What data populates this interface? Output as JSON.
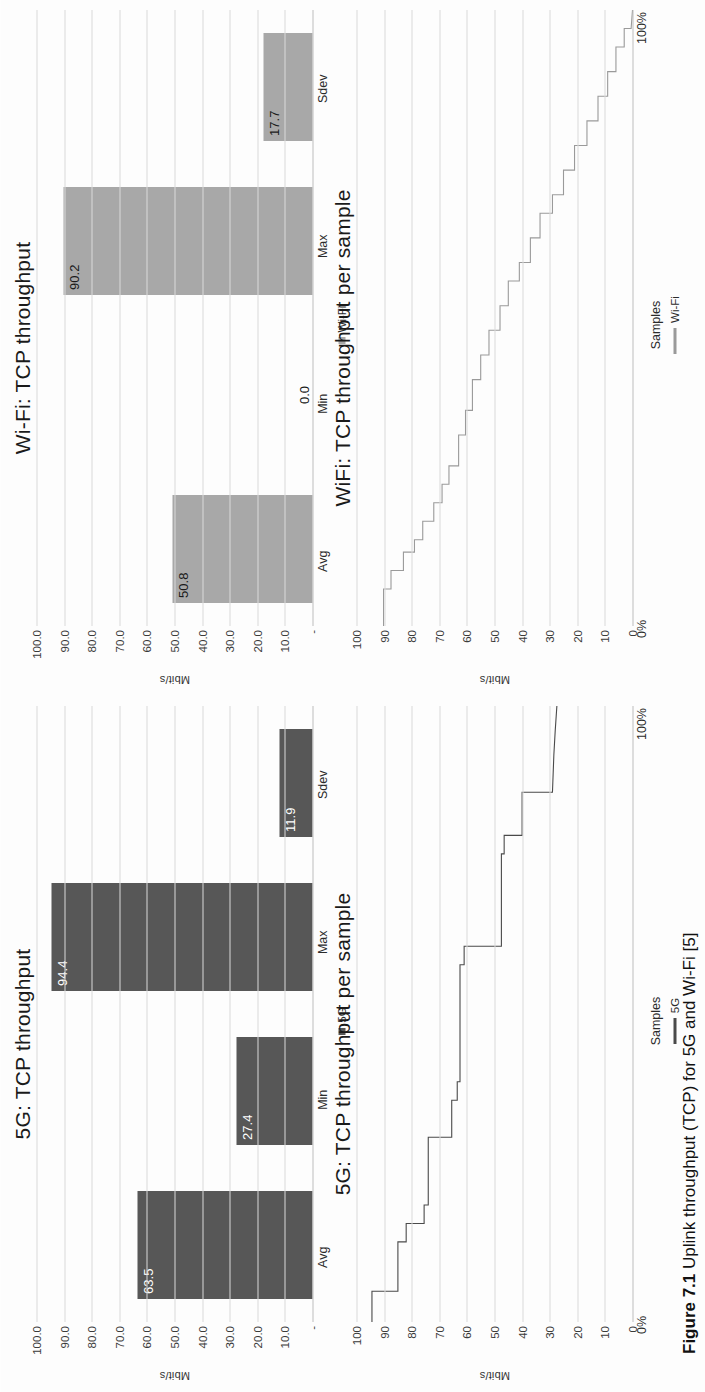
{
  "page": {
    "caption_label": "Figure 7.1",
    "caption_text": "Uplink throughput (TCP) for 5G and Wi-Fi [5]"
  },
  "panels": {
    "fiveg_bar": {
      "title": "5G: TCP throughput",
      "ylabel": "Mbit/s",
      "legend": "5G",
      "yticks": [
        "100.0",
        "90.0",
        "80.0",
        "70.0",
        "60.0",
        "50.0",
        "40.0",
        "30.0",
        "20.0",
        "10.0",
        "-"
      ]
    },
    "wifi_bar": {
      "title": "Wi-Fi: TCP throughput",
      "ylabel": "Mbit/s",
      "legend": "Wi-Fi",
      "yticks": [
        "100.0",
        "90.0",
        "80.0",
        "70.0",
        "60.0",
        "50.0",
        "40.0",
        "30.0",
        "20.0",
        "10.0",
        "-"
      ]
    },
    "fiveg_line": {
      "title": "5G: TCP throughput per sample",
      "ylabel": "Mbit/s",
      "xlabel": "Samples",
      "legend": "5G",
      "x_start": "0%",
      "x_end": "100%",
      "yticks": [
        "100",
        "90",
        "80",
        "70",
        "60",
        "50",
        "40",
        "30",
        "20",
        "10",
        "0"
      ]
    },
    "wifi_line": {
      "title": "WiFi: TCP throughput per sample",
      "ylabel": "Mbit/s",
      "xlabel": "Samples",
      "legend": "Wi-Fi",
      "x_start": "0%",
      "x_end": "100%",
      "yticks": [
        "100",
        "90",
        "80",
        "70",
        "60",
        "50",
        "40",
        "30",
        "20",
        "10",
        "0"
      ]
    }
  },
  "colors": {
    "bar_5g": "#575757",
    "bar_wifi": "#a8a8a8",
    "line_5g": "#4a4a4a",
    "line_wifi": "#9a9a9a",
    "gridline": "#d9d9d9"
  },
  "chart_data": [
    {
      "id": "fiveg_bar",
      "type": "bar",
      "title": "5G: TCP throughput",
      "xlabel": "",
      "ylabel": "Mbit/s",
      "ylim": [
        0,
        100
      ],
      "grid": true,
      "legend": "5G",
      "legend_position": "bottom",
      "categories": [
        "Avg",
        "Min",
        "Max",
        "Sdev"
      ],
      "values": [
        63.5,
        27.4,
        94.4,
        11.9
      ],
      "data_labels": [
        "63.5",
        "27.4",
        "94.4",
        "11.9"
      ],
      "tick_labels": [
        "100.0",
        "90.0",
        "80.0",
        "70.0",
        "60.0",
        "50.0",
        "40.0",
        "30.0",
        "20.0",
        "10.0",
        "-"
      ]
    },
    {
      "id": "wifi_bar",
      "type": "bar",
      "title": "Wi-Fi: TCP throughput",
      "xlabel": "",
      "ylabel": "Mbit/s",
      "ylim": [
        0,
        100
      ],
      "grid": true,
      "legend": "Wi-Fi",
      "legend_position": "bottom",
      "categories": [
        "Avg",
        "Min",
        "Max",
        "Sdev"
      ],
      "values": [
        50.8,
        0.0,
        90.2,
        17.7
      ],
      "data_labels": [
        "50.8",
        "0.0",
        "90.2",
        "17.7"
      ],
      "tick_labels": [
        "100.0",
        "90.0",
        "80.0",
        "70.0",
        "60.0",
        "50.0",
        "40.0",
        "30.0",
        "20.0",
        "10.0",
        "-"
      ]
    },
    {
      "id": "fiveg_line",
      "type": "line",
      "title": "5G: TCP throughput per sample",
      "xlabel": "Samples",
      "ylabel": "Mbit/s",
      "ylim": [
        0,
        100
      ],
      "xlim": [
        0,
        100
      ],
      "grid": true,
      "legend": "5G",
      "legend_position": "bottom",
      "x_tick_labels": [
        "0%",
        "100%"
      ],
      "y_tick_labels": [
        "100",
        "90",
        "80",
        "70",
        "60",
        "50",
        "40",
        "30",
        "20",
        "10",
        "0"
      ],
      "x": [
        0,
        5,
        5,
        13,
        13,
        16,
        16,
        19,
        19,
        30,
        30,
        36,
        36,
        39,
        39,
        58,
        58,
        61,
        61,
        76,
        76,
        79,
        79,
        86,
        86,
        92,
        96,
        100
      ],
      "y": [
        94.4,
        94.4,
        85.0,
        85.0,
        82.0,
        82.0,
        75.5,
        75.5,
        74.0,
        74.0,
        65.5,
        65.5,
        63.5,
        63.5,
        62.5,
        62.5,
        61.0,
        61.0,
        47.5,
        47.5,
        46.5,
        46.5,
        40.0,
        40.0,
        29.0,
        28.5,
        28.0,
        27.4
      ]
    },
    {
      "id": "wifi_line",
      "type": "line",
      "title": "WiFi: TCP throughput per sample",
      "xlabel": "Samples",
      "ylabel": "Mbit/s",
      "ylim": [
        0,
        100
      ],
      "xlim": [
        0,
        100
      ],
      "grid": true,
      "legend": "Wi-Fi",
      "legend_position": "bottom",
      "x_tick_labels": [
        "0%",
        "100%"
      ],
      "y_tick_labels": [
        "100",
        "90",
        "80",
        "70",
        "60",
        "50",
        "40",
        "30",
        "20",
        "10",
        "0"
      ],
      "x": [
        0,
        6,
        6,
        9,
        9,
        12,
        12,
        14,
        14,
        17,
        17,
        20,
        20,
        23,
        23,
        26,
        26,
        31,
        31,
        35,
        35,
        40,
        40,
        44,
        44,
        48,
        48,
        52,
        52,
        56,
        56,
        59,
        59,
        63,
        63,
        67,
        67,
        70,
        70,
        74,
        74,
        78,
        78,
        82,
        82,
        86,
        86,
        90,
        90,
        94,
        94,
        97,
        97,
        100
      ],
      "y": [
        90.2,
        90.2,
        87.5,
        87.5,
        83.0,
        83.0,
        79.0,
        79.0,
        76.0,
        76.0,
        72.0,
        72.0,
        69.0,
        69.0,
        66.5,
        66.5,
        63.0,
        63.0,
        60.5,
        60.5,
        58.0,
        58.0,
        55.0,
        55.0,
        52.0,
        52.0,
        48.0,
        48.0,
        45.0,
        45.0,
        41.0,
        41.0,
        37.0,
        37.0,
        33.5,
        33.5,
        29.0,
        29.0,
        25.0,
        25.0,
        21.0,
        21.0,
        16.5,
        16.5,
        12.5,
        12.5,
        9.0,
        9.0,
        6.0,
        6.0,
        3.0,
        3.0,
        0.5,
        0.0
      ]
    }
  ]
}
